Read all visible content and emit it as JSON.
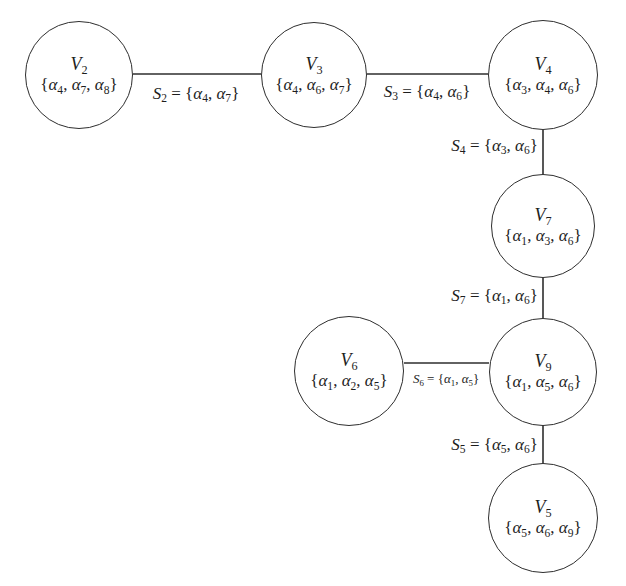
{
  "figure": {
    "background_color": "#ffffff",
    "ink_color": "#2e2e2e",
    "text_color": "#1d1d1d"
  },
  "graph": {
    "nodes": [
      {
        "id": "V2",
        "set": [
          "α4",
          "α7",
          "α8"
        ]
      },
      {
        "id": "V3",
        "set": [
          "α4",
          "α6",
          "α7"
        ]
      },
      {
        "id": "V4",
        "set": [
          "α3",
          "α4",
          "α6"
        ]
      },
      {
        "id": "V7",
        "set": [
          "α1",
          "α3",
          "α6"
        ]
      },
      {
        "id": "V6",
        "set": [
          "α1",
          "α2",
          "α5"
        ]
      },
      {
        "id": "V9",
        "set": [
          "α1",
          "α5",
          "α6"
        ]
      },
      {
        "id": "V5",
        "set": [
          "α5",
          "α6",
          "α9"
        ]
      }
    ],
    "edges": [
      {
        "id": "S2",
        "from": "V2",
        "to": "V3",
        "set": [
          "α4",
          "α7"
        ]
      },
      {
        "id": "S3",
        "from": "V3",
        "to": "V4",
        "set": [
          "α4",
          "α6"
        ]
      },
      {
        "id": "S4",
        "from": "V4",
        "to": "V7",
        "set": [
          "α3",
          "α6"
        ]
      },
      {
        "id": "S7",
        "from": "V7",
        "to": "V9",
        "set": [
          "α1",
          "α6"
        ]
      },
      {
        "id": "S6",
        "from": "V6",
        "to": "V9",
        "set": [
          "α1",
          "α5"
        ]
      },
      {
        "id": "S5",
        "from": "V9",
        "to": "V5",
        "set": [
          "α5",
          "α6"
        ]
      }
    ]
  }
}
